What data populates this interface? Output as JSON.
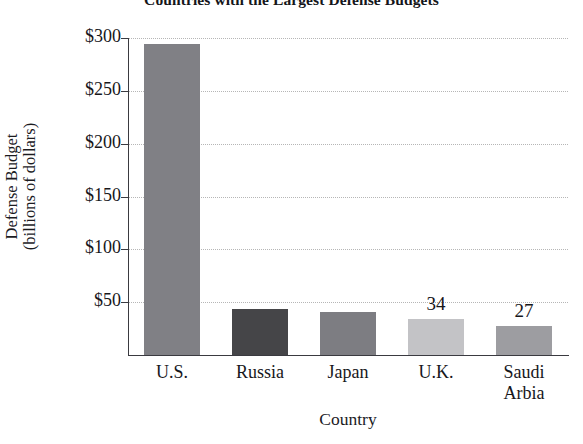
{
  "chart_data": {
    "type": "bar",
    "title": "Countries with the Largest Defense Budgets",
    "xlabel": "Country",
    "ylabel_line1": "Defense Budget",
    "ylabel_line2": "(billions of dollars)",
    "ylabel": "Defense Budget (billions of dollars)",
    "categories": [
      "U.S.",
      "Russia",
      "Japan",
      "U.K.",
      "Saudi Arbia"
    ],
    "values": [
      294,
      44,
      41,
      34,
      27
    ],
    "point_labels": [
      "",
      "",
      "",
      "34",
      "27"
    ],
    "ylim": [
      0,
      300
    ],
    "ytick_values": [
      300,
      250,
      200,
      150,
      100,
      50
    ],
    "ytick_labels": [
      "$300",
      "$250",
      "$200",
      "$150",
      "$100",
      "$50"
    ],
    "grid": true,
    "legend": "none",
    "bar_colors": [
      "#808085",
      "#454548",
      "#7d7d82",
      "#c3c3c6",
      "#9d9da1"
    ]
  },
  "axis": {
    "y_title_line1": "Defense Budget",
    "y_title_line2": "(billions of dollars)",
    "x_title": "Country"
  },
  "categories": [
    {
      "label_line1": "U.S.",
      "label_line2": ""
    },
    {
      "label_line1": "Russia",
      "label_line2": ""
    },
    {
      "label_line1": "Japan",
      "label_line2": ""
    },
    {
      "label_line1": "U.K.",
      "label_line2": ""
    },
    {
      "label_line1": "Saudi",
      "label_line2": "Arbia"
    }
  ],
  "colors": {
    "axis": "#3a3a40",
    "gridline": "#b6b6b6",
    "text": "#17171b",
    "background": "#ffffff"
  }
}
